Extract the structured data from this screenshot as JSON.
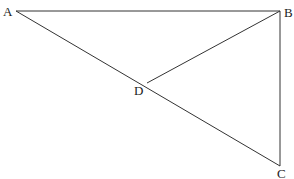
{
  "diagram": {
    "type": "geometry",
    "line_color": "#333333",
    "points": {
      "A": {
        "label": "A",
        "x": 16,
        "y": 11,
        "lx": 3,
        "ly": 16
      },
      "B": {
        "label": "B",
        "x": 280,
        "y": 11,
        "lx": 284,
        "ly": 17
      },
      "C": {
        "label": "C",
        "x": 280,
        "y": 166,
        "lx": 277,
        "ly": 178
      },
      "D": {
        "label": "D",
        "x": 147,
        "y": 83,
        "lx": 134,
        "ly": 95
      }
    },
    "segments": [
      {
        "from": "A",
        "to": "B"
      },
      {
        "from": "B",
        "to": "C"
      },
      {
        "from": "A",
        "to": "C"
      },
      {
        "from": "B",
        "to": "D"
      }
    ]
  }
}
